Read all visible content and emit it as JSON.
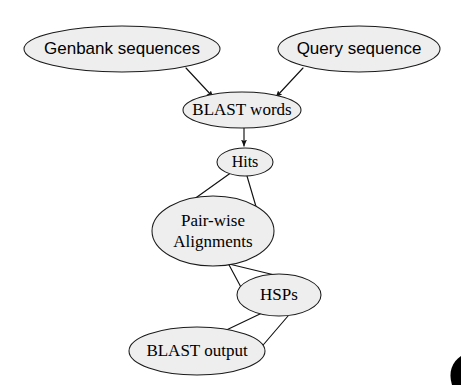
{
  "diagram": {
    "type": "flowchart",
    "canvas": {
      "width": 461,
      "height": 385
    },
    "style": {
      "node_fill": "#eeeeee",
      "node_stroke": "#1a1a1a",
      "edge_color": "#111111",
      "text_color": "#000000",
      "background": "#ffffff"
    },
    "nodes": [
      {
        "id": "genbank",
        "label": "Genbank sequences",
        "lines": [
          "Genbank sequences"
        ],
        "font": "sans",
        "font_size": 17,
        "cx": 122,
        "cy": 49,
        "rx": 98,
        "ry": 23
      },
      {
        "id": "query",
        "label": "Query sequence",
        "lines": [
          "Query sequence"
        ],
        "font": "sans",
        "font_size": 17,
        "cx": 359,
        "cy": 49,
        "rx": 81,
        "ry": 23
      },
      {
        "id": "blast_words",
        "label": "BLAST words",
        "lines": [
          "BLAST words"
        ],
        "font": "serif",
        "font_size": 17,
        "cx": 242,
        "cy": 110,
        "rx": 59,
        "ry": 18
      },
      {
        "id": "hits",
        "label": "Hits",
        "lines": [
          "Hits"
        ],
        "font": "serif",
        "font_size": 16,
        "cx": 245,
        "cy": 162,
        "rx": 28,
        "ry": 14
      },
      {
        "id": "pairwise",
        "label": "Pair-wise Alignments",
        "lines": [
          "Pair-wise",
          "Alignments"
        ],
        "font": "serif",
        "font_size": 17,
        "cx": 213,
        "cy": 231,
        "rx": 61,
        "ry": 35
      },
      {
        "id": "hsps",
        "label": "HSPs",
        "lines": [
          "HSPs"
        ],
        "font": "serif",
        "font_size": 17,
        "cx": 279,
        "cy": 295,
        "rx": 42,
        "ry": 21
      },
      {
        "id": "blast_output",
        "label": "BLAST output",
        "lines": [
          "BLAST output"
        ],
        "font": "serif",
        "font_size": 17,
        "cx": 197,
        "cy": 351,
        "rx": 68,
        "ry": 24
      }
    ],
    "edges": [
      {
        "id": "genbank-to-words",
        "from": "genbank",
        "to": "blast_words",
        "arrow": true
      },
      {
        "id": "query-to-words",
        "from": "query",
        "to": "blast_words",
        "arrow": true
      },
      {
        "id": "words-to-hits",
        "from": "blast_words",
        "to": "hits",
        "arrow": true
      },
      {
        "id": "hits-to-pairwise-left",
        "from": "hits",
        "to": "pairwise",
        "arrow": false
      },
      {
        "id": "hits-to-pairwise-right",
        "from": "hits",
        "to": "pairwise",
        "arrow": false
      },
      {
        "id": "pairwise-to-hsps-left",
        "from": "pairwise",
        "to": "hsps",
        "arrow": false
      },
      {
        "id": "pairwise-to-hsps-right",
        "from": "pairwise",
        "to": "hsps",
        "arrow": false
      },
      {
        "id": "hsps-to-output-left",
        "from": "hsps",
        "to": "blast_output",
        "arrow": false
      },
      {
        "id": "hsps-to-output-right",
        "from": "hsps",
        "to": "blast_output",
        "arrow": false
      }
    ]
  }
}
